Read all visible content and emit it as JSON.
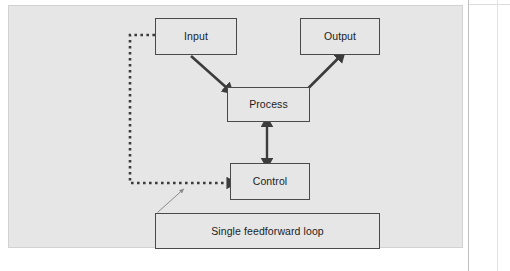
{
  "figure": {
    "panel": {
      "background_color": "#e6e6e6",
      "border_color": "#d2d2d2"
    },
    "nodes": [
      {
        "id": "input",
        "label": "Input"
      },
      {
        "id": "output",
        "label": "Output"
      },
      {
        "id": "process",
        "label": "Process"
      },
      {
        "id": "control",
        "label": "Control"
      },
      {
        "id": "caption",
        "label": "Single feedforward loop"
      }
    ],
    "connectors": [
      {
        "id": "input-to-process",
        "from": "input",
        "to": "process",
        "style": "solid-thick",
        "heads": "single",
        "color": "#3c3c3c"
      },
      {
        "id": "process-to-output",
        "from": "process",
        "to": "output",
        "style": "solid-thick",
        "heads": "single",
        "color": "#3c3c3c"
      },
      {
        "id": "process-control-bidirectional",
        "from": "process",
        "to": "control",
        "style": "solid-thick",
        "heads": "double",
        "color": "#3c3c3c"
      },
      {
        "id": "input-to-control-feedforward",
        "from": "input",
        "to": "control",
        "style": "dotted-thick",
        "heads": "single",
        "color": "#3c3c3c"
      },
      {
        "id": "caption-leader",
        "from": "caption",
        "to": "input-to-control-feedforward",
        "style": "solid-thin-leader",
        "heads": "single",
        "color": "#8a8a8a"
      }
    ],
    "node_style": {
      "fill_color": "#e6e6e6",
      "stroke_color": "#4a4a4a",
      "text_color": "#1c1c1c"
    },
    "bottom_ghost_text": ""
  }
}
